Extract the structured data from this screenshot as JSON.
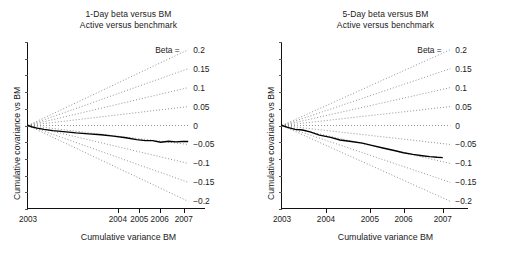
{
  "chart_data": [
    {
      "type": "line",
      "panel": "left",
      "title": "1-Day beta versus BM",
      "subtitle": "Active versus benchmark",
      "xlabel": "Cumulative variance BM",
      "ylabel": "Cumulative covariance vs BM",
      "grid": false,
      "legend_position": "right-inline",
      "beta_head_label": "Beta =",
      "beta_lines": [
        "0.2",
        "0.15",
        "0.1",
        "0.05",
        "0",
        "-0.05",
        "-0.1",
        "-0.15",
        "-0.2"
      ],
      "beta_values": [
        0.2,
        0.15,
        0.1,
        0.05,
        0,
        -0.05,
        -0.1,
        -0.15,
        -0.2
      ],
      "xticks": [
        "2003",
        "2004",
        "2005",
        "2006",
        "2007"
      ],
      "xtick_frac": [
        0.0,
        0.505,
        0.625,
        0.74,
        0.875
      ],
      "ylim": [
        -0.26,
        0.26
      ],
      "series": [
        {
          "name": "Active cumulative covariance",
          "style": "solid",
          "x": [
            0.0,
            0.02,
            0.05,
            0.09,
            0.14,
            0.2,
            0.27,
            0.34,
            0.41,
            0.48,
            0.55,
            0.61,
            0.66,
            0.7,
            0.745,
            0.79,
            0.83,
            0.865,
            0.9
          ],
          "y": [
            0.0,
            -0.004,
            -0.008,
            -0.012,
            -0.016,
            -0.019,
            -0.023,
            -0.026,
            -0.029,
            -0.033,
            -0.038,
            -0.044,
            -0.047,
            -0.047,
            -0.052,
            -0.049,
            -0.051,
            -0.05,
            -0.05
          ]
        }
      ]
    },
    {
      "type": "line",
      "panel": "right",
      "title": "5-Day beta versus BM",
      "subtitle": "Active versus benchmark",
      "xlabel": "Cumulative variance BM",
      "ylabel": "Cumulative covariance vs BM",
      "grid": false,
      "legend_position": "right-inline",
      "beta_head_label": "Beta =",
      "beta_lines": [
        "0.2",
        "0.15",
        "0.1",
        "0.05",
        "0",
        "-0.05",
        "-0.1",
        "-0.15",
        "-0.2"
      ],
      "beta_values": [
        0.2,
        0.15,
        0.1,
        0.05,
        0,
        -0.05,
        -0.1,
        -0.15,
        -0.2
      ],
      "xticks": [
        "2003",
        "2004",
        "2005",
        "2006",
        "2007"
      ],
      "xtick_frac": [
        0.0,
        0.235,
        0.47,
        0.65,
        0.86
      ],
      "ylim": [
        -0.26,
        0.26
      ],
      "series": [
        {
          "name": "Active cumulative covariance",
          "style": "solid",
          "x": [
            0.0,
            0.03,
            0.07,
            0.11,
            0.15,
            0.2,
            0.26,
            0.31,
            0.37,
            0.43,
            0.48,
            0.54,
            0.6,
            0.65,
            0.7,
            0.75,
            0.79,
            0.83,
            0.86
          ],
          "y": [
            0.0,
            -0.006,
            -0.012,
            -0.014,
            -0.02,
            -0.03,
            -0.037,
            -0.045,
            -0.05,
            -0.055,
            -0.062,
            -0.07,
            -0.078,
            -0.085,
            -0.09,
            -0.094,
            -0.097,
            -0.099,
            -0.1
          ]
        }
      ]
    }
  ],
  "colors": {
    "axis": "#111111",
    "line": "#000000",
    "dotted": "#777777",
    "text": "#1a1a1a",
    "background": "#ffffff"
  }
}
